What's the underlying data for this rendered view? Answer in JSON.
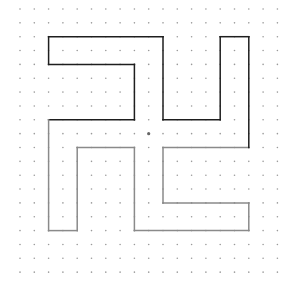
{
  "grid": {
    "cols": 19,
    "rows": 20,
    "origin_x": 20,
    "origin_y": 9,
    "step_x": 14.3,
    "step_y": 13.85,
    "dot_color": "#9a9a9a",
    "dot_radius": 0.8
  },
  "center_dot": {
    "col": 9,
    "row": 9,
    "color": "#666666",
    "radius": 1.6
  },
  "path": {
    "points_grid": [
      [
        10,
        2
      ],
      [
        2,
        2
      ],
      [
        2,
        4
      ],
      [
        8,
        4
      ],
      [
        8,
        8
      ],
      [
        2,
        8
      ],
      [
        2,
        16
      ],
      [
        4,
        16
      ],
      [
        4,
        10
      ],
      [
        8,
        10
      ],
      [
        8,
        16
      ],
      [
        16,
        16
      ],
      [
        16,
        14
      ],
      [
        10,
        14
      ],
      [
        10,
        10
      ],
      [
        16,
        10
      ],
      [
        16,
        2
      ],
      [
        14,
        2
      ],
      [
        14,
        8
      ],
      [
        10,
        8
      ],
      [
        10,
        2
      ]
    ],
    "dark_color": "#1e1e1e",
    "light_color": "#8a8a8a",
    "split_row": 9,
    "stroke_width": 1.5
  }
}
